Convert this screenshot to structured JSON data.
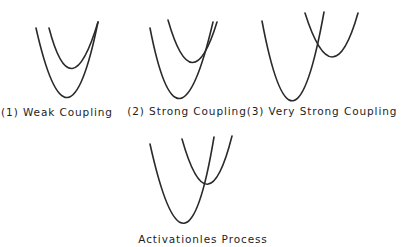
{
  "figure": {
    "panels": [
      {
        "id": "weak",
        "label": "(1) Weak Coupling",
        "label_pos": [
          57,
          106
        ],
        "curves": {
          "lower": "M36,28 Q68,170 98,22",
          "upper": "M49,28 Q71,112 98,22"
        }
      },
      {
        "id": "strong",
        "label": "(2) Strong Coupling",
        "label_pos": [
          187,
          105
        ],
        "curves": {
          "lower": "M150,28 Q178,172 213,22",
          "upper": "M168,20 Q192,104 217,22"
        }
      },
      {
        "id": "very-strong",
        "label": "(3) Very Strong Coupling",
        "label_pos": [
          322,
          105
        ],
        "curves": {
          "lower": "M262,21 Q293,185 324,12",
          "upper": "M305,13 Q333,101 358,13"
        }
      },
      {
        "id": "activationless",
        "label": "Activationles Process",
        "label_pos": [
          203,
          233
        ],
        "curves": {
          "lower": "M150,144 Q186,306 214,137",
          "upper": "M182,139 Q208,231 232,136"
        }
      }
    ],
    "stroke_color": "#2a2a2a",
    "background": "#ffffff"
  }
}
